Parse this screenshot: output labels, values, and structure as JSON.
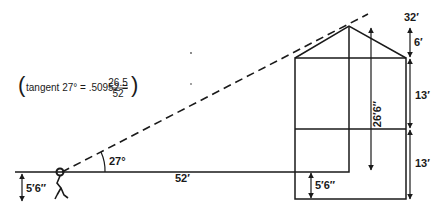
{
  "diagram": {
    "formula": {
      "prefix": "tangent 27° = .50952 =",
      "numerator": "26.5",
      "denominator": "52"
    },
    "labels": {
      "angle": "27°",
      "distance": "52′",
      "eye_height_left": "5′6″",
      "eye_height_right": "5′6″",
      "sight_height": "26′6″",
      "total_height": "32′",
      "roof_height": "6′",
      "upper_section": "13′",
      "lower_section": "13′"
    },
    "colors": {
      "line": "#1a1a1a",
      "background": "#ffffff"
    }
  }
}
